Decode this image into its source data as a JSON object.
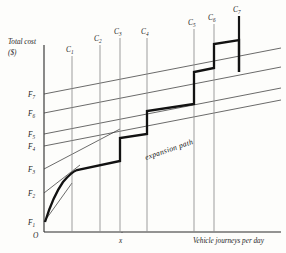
{
  "figure": {
    "y_axis_label_line1": "Total cost",
    "y_axis_label_line2": "($)",
    "x_axis_label": "Vehicle journeys per day",
    "x_tick_label": "x",
    "origin_label": "O",
    "annotation_expansion_path": "expansion path"
  },
  "chart_data": {
    "type": "line",
    "xlabel": "Vehicle journeys per day",
    "ylabel": "Total cost ($)",
    "grid": false,
    "legend": "none",
    "xlim": [
      0,
      100
    ],
    "ylim": [
      0,
      100
    ],
    "origin_label": "O",
    "x_tick_labels": [
      "x"
    ],
    "x_tick_positions": [
      33
    ],
    "annotations": [
      {
        "text": "expansion path",
        "x": 55,
        "y": 40,
        "rotation": -19,
        "style": "italic"
      }
    ],
    "fixed_cost_levels": {
      "description": "Horizontal-axis intercepts of the total-cost lines on the vertical axis; each cost line rises linearly to the right from its intercept.",
      "labels": [
        "F1",
        "F2",
        "F3",
        "F4",
        "F5",
        "F6",
        "F7"
      ],
      "label_text": [
        "F₁",
        "F₂",
        "F₃",
        "F₄",
        "F₅",
        "F₆",
        "F₇"
      ],
      "intercepts": [
        10.5,
        25.5,
        38.5,
        50.5,
        57.0,
        68.5,
        78.5
      ],
      "slopes": [
        0.98,
        0.56,
        0.36,
        0.2,
        0.2,
        0.2,
        0.2
      ]
    },
    "capacity_lines": {
      "description": "Vertical capacity-constraint lines; the last one (C7) is drawn bold.",
      "labels": [
        "C1",
        "C2",
        "C3",
        "C4",
        "C5",
        "C6",
        "C7"
      ],
      "label_text": [
        "C₁",
        "C₂",
        "C₃",
        "C₄",
        "C₅",
        "C₆",
        "C₇"
      ],
      "x_values": [
        14.5,
        26.0,
        33.5,
        42.0,
        62.0,
        72.5,
        82.0
      ],
      "top_values": [
        83.0,
        88.5,
        91.5,
        91.5,
        95.0,
        97.5,
        100.0
      ],
      "bold": [
        false,
        false,
        false,
        false,
        false,
        false,
        true
      ]
    },
    "series": [
      {
        "name": "expansion path",
        "style": "thick staircase",
        "points_x": [
          0.6,
          2.0,
          4.0,
          6.5,
          9.0,
          12.0,
          14.5,
          14.5,
          26.0,
          26.0,
          33.5,
          33.5,
          42.0,
          42.0,
          62.0,
          62.0,
          72.5,
          72.5,
          82.0,
          82.0
        ],
        "points_y": [
          10.5,
          22.0,
          30.5,
          36.0,
          39.0,
          41.0,
          42.0,
          42.0,
          45.5,
          45.5,
          53.5,
          53.5,
          58.5,
          62.5,
          68.5,
          73.5,
          78.0,
          83.5,
          87.5,
          87.5
        ]
      }
    ]
  }
}
